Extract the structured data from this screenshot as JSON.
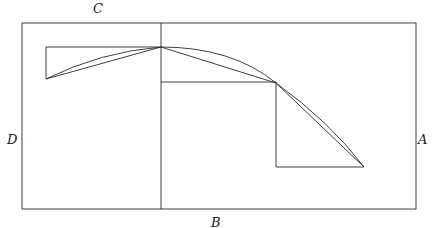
{
  "figure": {
    "type": "geometric-diagram",
    "caption": "",
    "width": 442,
    "height": 228,
    "background_color": "#ffffff",
    "stroke_color": "#2b2b2b",
    "stroke_width": 0.9,
    "labels": {
      "top": "C",
      "left": "D",
      "right": "A",
      "bottom": "B"
    },
    "label_positions": {
      "top": {
        "x": 97,
        "y": 8
      },
      "left": {
        "x": 12,
        "y": 140
      },
      "right": {
        "x": 423,
        "y": 140
      },
      "bottom": {
        "x": 216,
        "y": 222
      }
    },
    "outer_rectangle": {
      "x": 22,
      "y": 23,
      "width": 394,
      "height": 186
    },
    "axis_vertical": {
      "x": 161,
      "y1": 23,
      "y2": 209
    },
    "points": {
      "P_left": {
        "x": 46,
        "y": 79
      },
      "P_apex": {
        "x": 161,
        "y": 47
      },
      "P_mid": {
        "x": 276,
        "y": 83
      },
      "P_right": {
        "x": 364,
        "y": 167
      }
    },
    "step_polyline_left": [
      {
        "x": 46,
        "y": 79
      },
      {
        "x": 46,
        "y": 47
      },
      {
        "x": 161,
        "y": 47
      }
    ],
    "step_polyline_right": [
      {
        "x": 161,
        "y": 82
      },
      {
        "x": 276,
        "y": 82
      },
      {
        "x": 276,
        "y": 167
      },
      {
        "x": 364,
        "y": 167
      }
    ],
    "chords": [
      {
        "from": "P_left",
        "to": "P_apex"
      },
      {
        "from": "P_apex",
        "to": "P_mid"
      },
      {
        "from": "P_mid",
        "to": "P_right"
      }
    ],
    "curve_description": "smooth concave-down arc through P_left, P_apex, P_mid and P_right"
  }
}
